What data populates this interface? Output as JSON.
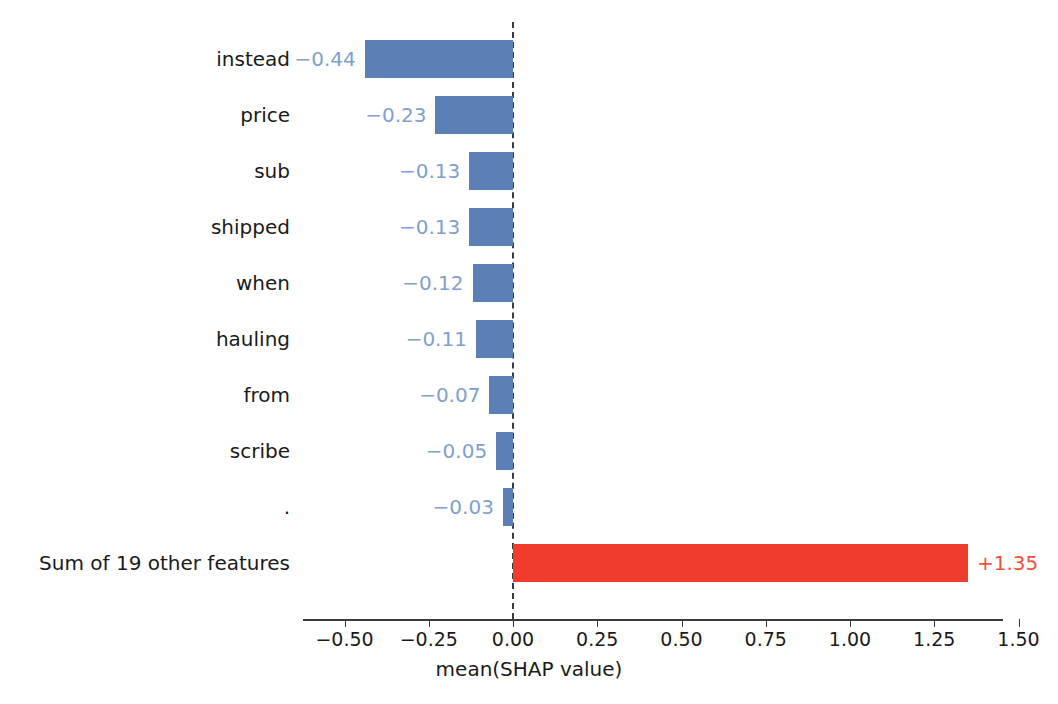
{
  "figure": {
    "top_caption_remnant": "",
    "x_axis_title": "mean(SHAP value)",
    "colors": {
      "negative_bar": "#5c7fb6",
      "positive_bar": "#f03c2c",
      "negative_label": "#7f9fcd",
      "positive_label": "#f0503c",
      "axis": "#3b3b3b",
      "background": "#ffffff"
    }
  },
  "chart_data": {
    "type": "bar",
    "orientation": "horizontal",
    "title": "",
    "xlabel": "mean(SHAP value)",
    "ylabel": "",
    "xlim": [
      -0.62,
      1.5
    ],
    "xticks": [
      -0.5,
      -0.25,
      0.0,
      0.25,
      0.5,
      0.75,
      1.0,
      1.25,
      1.5
    ],
    "xticklabels": [
      "−0.50",
      "−0.25",
      "0.00",
      "0.25",
      "0.50",
      "0.75",
      "1.00",
      "1.25",
      "1.50"
    ],
    "grid": false,
    "legend": false,
    "zero_reference_line": 0.0,
    "categories": [
      "instead",
      "price",
      "sub",
      "shipped",
      "when",
      "hauling",
      "from",
      "scribe",
      ".",
      "Sum of 19 other features"
    ],
    "values": [
      -0.44,
      -0.23,
      -0.13,
      -0.13,
      -0.12,
      -0.11,
      -0.07,
      -0.05,
      -0.03,
      1.35
    ],
    "value_labels": [
      "−0.44",
      "−0.23",
      "−0.13",
      "−0.13",
      "−0.12",
      "−0.11",
      "−0.07",
      "−0.05",
      "−0.03",
      "+1.35"
    ],
    "bar_colors": [
      "#5c7fb6",
      "#5c7fb6",
      "#5c7fb6",
      "#5c7fb6",
      "#5c7fb6",
      "#5c7fb6",
      "#5c7fb6",
      "#5c7fb6",
      "#5c7fb6",
      "#f03c2c"
    ]
  },
  "rows": [
    {
      "label": "instead",
      "value_label": "−0.44",
      "sign": "neg"
    },
    {
      "label": "price",
      "value_label": "−0.23",
      "sign": "neg"
    },
    {
      "label": "sub",
      "value_label": "−0.13",
      "sign": "neg"
    },
    {
      "label": "shipped",
      "value_label": "−0.13",
      "sign": "neg"
    },
    {
      "label": "when",
      "value_label": "−0.12",
      "sign": "neg"
    },
    {
      "label": "hauling",
      "value_label": "−0.11",
      "sign": "neg"
    },
    {
      "label": "from",
      "value_label": "−0.07",
      "sign": "neg"
    },
    {
      "label": "scribe",
      "value_label": "−0.05",
      "sign": "neg"
    },
    {
      "label": ".",
      "value_label": "−0.03",
      "sign": "neg"
    },
    {
      "label": "Sum of 19 other features",
      "value_label": "+1.35",
      "sign": "pos"
    }
  ]
}
